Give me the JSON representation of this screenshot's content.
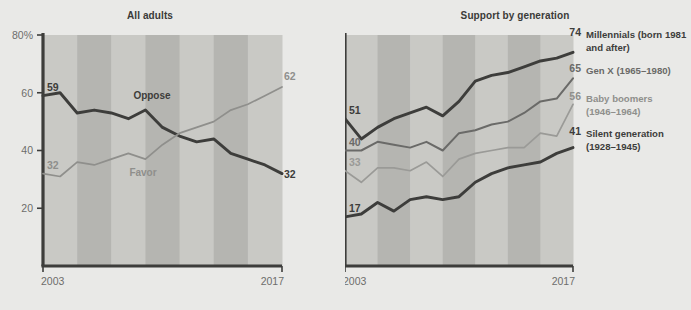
{
  "figure": {
    "background_color": "#e9e9e7",
    "band_light": "#c9c9c5",
    "band_dark": "#b5b5b1",
    "axis_color": "#3d3d3b"
  },
  "panels": [
    {
      "id": "all-adults",
      "title": "All adults",
      "y_axis": {
        "ticks": [
          "80%",
          "60",
          "40",
          "20"
        ],
        "values": [
          80,
          60,
          40,
          20
        ],
        "min": 0,
        "max": 80
      },
      "x_axis": {
        "ticks": [
          "2003",
          "2017"
        ],
        "start": 2003,
        "end": 2017
      }
    },
    {
      "id": "support-by-generation",
      "title": "Support by generation",
      "y_axis": {
        "ticks": [
          "80%",
          "60",
          "40",
          "20"
        ],
        "values": [
          80,
          60,
          40,
          20
        ],
        "min": 0,
        "max": 80
      },
      "x_axis": {
        "ticks": [
          "2003",
          "2017"
        ],
        "start": 2003,
        "end": 2017
      }
    }
  ],
  "legend": {
    "items": [
      {
        "line1": "Millennials (born 1981",
        "line2": "and after)",
        "color": "#3d3d3b",
        "end_value": "74"
      },
      {
        "line1": "Gen X (1965–1980)",
        "line2": "",
        "color": "#6a6a68",
        "end_value": "65"
      },
      {
        "line1": "Baby boomers",
        "line2": "(1946–1964)",
        "color": "#8f8f8c",
        "end_value": "56"
      },
      {
        "line1": "Silent generation",
        "line2": "(1928–1945)",
        "color": "#3d3d3b",
        "end_value": "41"
      }
    ]
  },
  "inline_labels": {
    "oppose": "Oppose",
    "favor": "Favor"
  },
  "chart_data": [
    {
      "type": "line",
      "title": "All adults",
      "xlabel": "",
      "ylabel": "",
      "ylim": [
        0,
        80
      ],
      "xlim": [
        2003,
        2017
      ],
      "grid": false,
      "legend_position": "inline",
      "x": [
        2003,
        2004,
        2005,
        2006,
        2007,
        2008,
        2009,
        2010,
        2011,
        2012,
        2013,
        2014,
        2015,
        2016,
        2017
      ],
      "series": [
        {
          "name": "Oppose",
          "color": "#3d3d3b",
          "width": "thick",
          "start_value": 59,
          "end_value": 32,
          "values": [
            59,
            60,
            53,
            54,
            53,
            51,
            54,
            48,
            45,
            43,
            44,
            39,
            37,
            35,
            32
          ]
        },
        {
          "name": "Favor",
          "color": "#8f8f8c",
          "width": "thin",
          "start_value": 32,
          "end_value": 62,
          "values": [
            32,
            31,
            36,
            35,
            37,
            39,
            37,
            42,
            46,
            48,
            50,
            54,
            56,
            59,
            62
          ]
        }
      ]
    },
    {
      "type": "line",
      "title": "Support by generation",
      "xlabel": "",
      "ylabel": "",
      "ylim": [
        0,
        80
      ],
      "xlim": [
        2003,
        2017
      ],
      "grid": false,
      "legend_position": "right",
      "x": [
        2003,
        2004,
        2005,
        2006,
        2007,
        2008,
        2009,
        2010,
        2011,
        2012,
        2013,
        2014,
        2015,
        2016,
        2017
      ],
      "series": [
        {
          "name": "Millennials (born 1981 and after)",
          "color": "#3d3d3b",
          "width": "thick",
          "start_value": 51,
          "end_value": 74,
          "values": [
            51,
            44,
            48,
            51,
            53,
            55,
            52,
            57,
            64,
            66,
            67,
            69,
            71,
            72,
            74
          ]
        },
        {
          "name": "Gen X (1965–1980)",
          "color": "#6a6a68",
          "width": "medium",
          "start_value": 40,
          "end_value": 65,
          "values": [
            40,
            40,
            43,
            42,
            41,
            43,
            40,
            46,
            47,
            49,
            50,
            53,
            57,
            58,
            65
          ]
        },
        {
          "name": "Baby boomers (1946–1964)",
          "color": "#9a9a97",
          "width": "thin",
          "start_value": 33,
          "end_value": 56,
          "values": [
            33,
            29,
            34,
            34,
            33,
            36,
            31,
            37,
            39,
            40,
            41,
            41,
            46,
            45,
            56
          ]
        },
        {
          "name": "Silent generation (1928–1945)",
          "color": "#3d3d3b",
          "width": "thick",
          "start_value": 17,
          "end_value": 41,
          "values": [
            17,
            18,
            22,
            19,
            23,
            24,
            23,
            24,
            29,
            32,
            34,
            35,
            36,
            39,
            41
          ]
        }
      ]
    }
  ]
}
